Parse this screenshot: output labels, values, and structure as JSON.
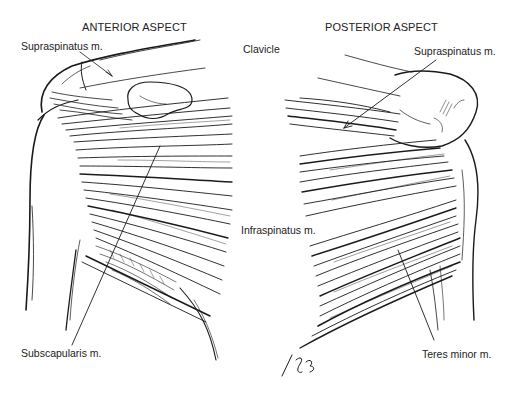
{
  "figure": {
    "views": [
      {
        "title": "ANTERIOR ASPECT",
        "labels": {
          "supraspinatus": "Supraspinatus m.",
          "subscapularis": "Subscapularis m."
        }
      },
      {
        "title": "POSTERIOR ASPECT",
        "labels": {
          "clavicle": "Clavicle",
          "supraspinatus": "Supraspinatus m.",
          "infraspinatus": "Infraspinatus m.",
          "teres_minor": "Teres minor m."
        }
      }
    ],
    "colors": {
      "ink": "#1a1a1a",
      "background": "#ffffff"
    }
  }
}
